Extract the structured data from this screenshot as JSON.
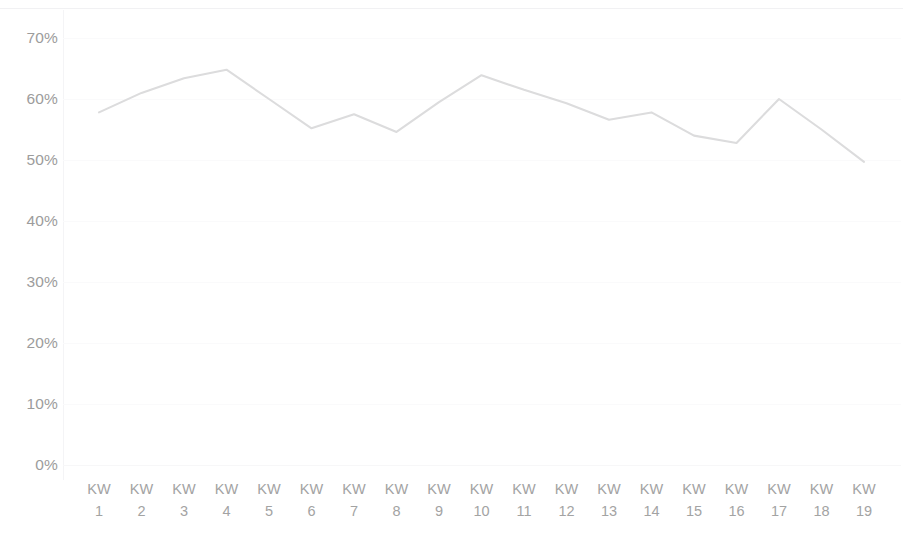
{
  "chart_data": {
    "type": "line",
    "title": "",
    "subtitle": "",
    "xlabel": "",
    "ylabel": "",
    "categories": [
      "KW 1",
      "KW 2",
      "KW 3",
      "KW 4",
      "KW 5",
      "KW 6",
      "KW 7",
      "KW 8",
      "KW 9",
      "KW 10",
      "KW 11",
      "KW 12",
      "KW 13",
      "KW 14",
      "KW 15",
      "KW 16",
      "KW 17",
      "KW 18",
      "KW 19"
    ],
    "category_prefix": "KW",
    "category_numbers": [
      "1",
      "2",
      "3",
      "4",
      "5",
      "6",
      "7",
      "8",
      "9",
      "10",
      "11",
      "12",
      "13",
      "14",
      "15",
      "16",
      "17",
      "18",
      "19"
    ],
    "series": [
      {
        "name": "",
        "values": [
          57.8,
          61.0,
          63.4,
          64.8,
          60.0,
          55.2,
          57.5,
          54.6,
          59.5,
          63.9,
          61.5,
          59.3,
          56.6,
          57.8,
          54.0,
          52.8,
          60.0,
          55.0,
          49.7
        ]
      }
    ],
    "ylim": [
      0,
      70
    ],
    "ytick_values": [
      0,
      10,
      20,
      30,
      40,
      50,
      60,
      70
    ],
    "ytick_labels": [
      "0%",
      "10%",
      "20%",
      "30%",
      "40%",
      "50%",
      "60%",
      "70%"
    ],
    "value_suffix": "%",
    "grid": true,
    "grid_axis": "y",
    "legend": false,
    "legend_position": "none",
    "annotations": [],
    "colors": {
      "line": "#dcdcdd",
      "axis_text": "#9c9c9c",
      "grid": "#fafafb",
      "background": "#ffffff",
      "axis_line": "#f4f4f6"
    }
  }
}
